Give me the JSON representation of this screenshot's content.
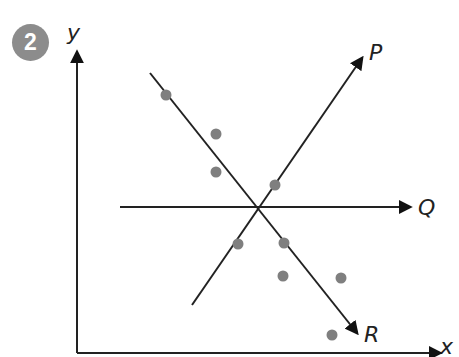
{
  "question": {
    "number": "2"
  },
  "axes": {
    "x_label": "x",
    "y_label": "y"
  },
  "lines": [
    {
      "name": "P",
      "x1": 192,
      "y1": 305,
      "x2": 362,
      "y2": 58
    },
    {
      "name": "Q",
      "x1": 120,
      "y1": 207,
      "x2": 410,
      "y2": 207
    },
    {
      "name": "R",
      "x1": 150,
      "y1": 73,
      "x2": 357,
      "y2": 333
    }
  ],
  "points": [
    [
      166,
      95
    ],
    [
      216,
      134
    ],
    [
      216,
      172
    ],
    [
      275,
      185
    ],
    [
      238,
      244
    ],
    [
      284,
      243
    ],
    [
      283,
      276
    ],
    [
      341,
      278
    ],
    [
      332,
      335
    ]
  ],
  "colors": {
    "line": "#222222",
    "point": "#7f7f7f",
    "badge": "#8c8c8c"
  }
}
